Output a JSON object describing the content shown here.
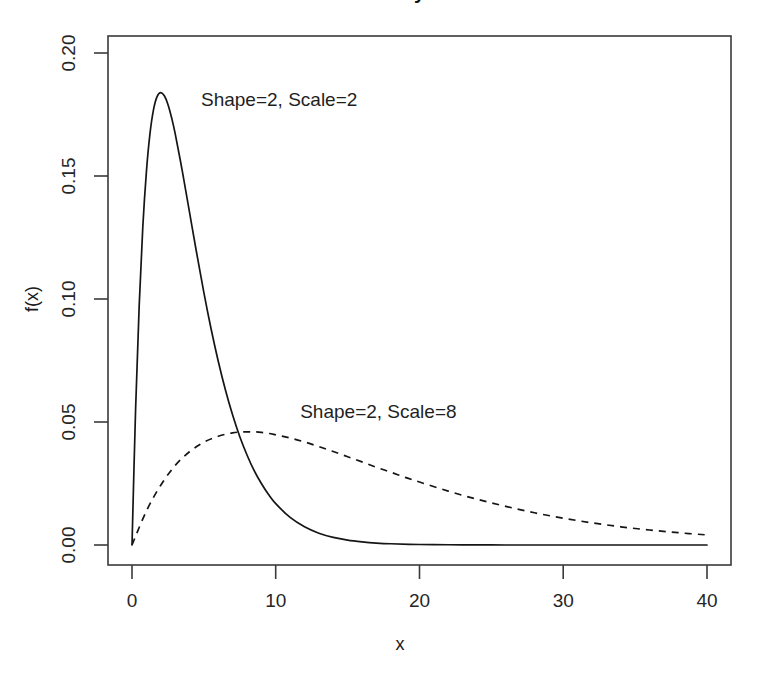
{
  "chart_data": {
    "type": "line",
    "title": "Gamma Density Functions",
    "title_clipped": true,
    "xlabel": "x",
    "ylabel": "f(x)",
    "xlim": [
      0,
      41.2
    ],
    "ylim": [
      0,
      0.2135
    ],
    "xticks": [
      0,
      10,
      20,
      30,
      40
    ],
    "xtick_labels": [
      "0",
      "10",
      "20",
      "30",
      "40"
    ],
    "yticks": [
      0.0,
      0.05,
      0.1,
      0.15,
      0.2
    ],
    "ytick_labels": [
      "0.00",
      "0.05",
      "0.10",
      "0.15",
      "0.20"
    ],
    "grid": false,
    "legend_position": "inline-annotations",
    "series": [
      {
        "name": "Shape=2, Scale=2",
        "style": "solid",
        "color": "#151515",
        "shape": 2,
        "scale": 2,
        "peak_x": 2,
        "peak_y": 0.1839,
        "annotation": {
          "text": "Shape=2, Scale=2",
          "x": 4.8,
          "y": 0.1805
        },
        "x": [
          0,
          0.25,
          0.5,
          0.75,
          1,
          1.25,
          1.5,
          1.75,
          2,
          2.25,
          2.5,
          2.75,
          3,
          3.5,
          4,
          4.5,
          5,
          5.5,
          6,
          6.5,
          7,
          7.5,
          8,
          8.5,
          9,
          9.5,
          10,
          11,
          12,
          13,
          14,
          15,
          16,
          17,
          18,
          20,
          22,
          24,
          26,
          28,
          30,
          34,
          38,
          40
        ],
        "y": [
          0,
          0.0551,
          0.0973,
          0.1291,
          0.1516,
          0.1672,
          0.1771,
          0.1824,
          0.1839,
          0.1826,
          0.1791,
          0.1738,
          0.1673,
          0.152,
          0.1353,
          0.1186,
          0.1026,
          0.0879,
          0.0747,
          0.063,
          0.0528,
          0.044,
          0.0366,
          0.0302,
          0.025,
          0.0205,
          0.0168,
          0.0112,
          0.0074,
          0.0048,
          0.0031,
          0.002,
          0.0013,
          0.0008,
          0.0005,
          0.0002,
          0.0001,
          4e-05,
          1e-05,
          6e-06,
          2e-06,
          3e-07,
          4e-08,
          1e-08
        ]
      },
      {
        "name": "Shape=2, Scale=8",
        "style": "dashed",
        "color": "#151515",
        "shape": 2,
        "scale": 8,
        "peak_x": 8,
        "peak_y": 0.046,
        "annotation": {
          "text": "Shape=2, Scale=8",
          "x": 11.7,
          "y": 0.0538
        },
        "x": [
          0,
          1,
          2,
          3,
          4,
          5,
          6,
          7,
          8,
          9,
          10,
          11,
          12,
          13,
          14,
          15,
          16,
          17,
          18,
          19,
          20,
          22,
          24,
          26,
          28,
          30,
          32,
          34,
          36,
          38,
          40
        ],
        "y": [
          0,
          0.0138,
          0.0243,
          0.0323,
          0.0379,
          0.0418,
          0.0442,
          0.0456,
          0.046,
          0.0458,
          0.0448,
          0.0435,
          0.0419,
          0.04,
          0.038,
          0.0359,
          0.0338,
          0.0316,
          0.0296,
          0.0275,
          0.0256,
          0.0219,
          0.0186,
          0.0157,
          0.0131,
          0.0109,
          0.009,
          0.0074,
          0.0061,
          0.005,
          0.0041
        ]
      }
    ]
  },
  "axes": {
    "ylabel": "f(x)",
    "xlabel": "x"
  },
  "ticks": {
    "x": [
      "0",
      "10",
      "20",
      "30",
      "40"
    ],
    "y": [
      "0.00",
      "0.05",
      "0.10",
      "0.15",
      "0.20"
    ]
  },
  "annotations": {
    "solid": "Shape=2, Scale=2",
    "dashed": "Shape=2, Scale=8"
  },
  "title": {
    "text": "Gamma Density Functions"
  },
  "colors": {
    "background": "#ffffff",
    "line": "#151515",
    "axis": "#3a3a3a",
    "text": "#1f1f1f"
  }
}
